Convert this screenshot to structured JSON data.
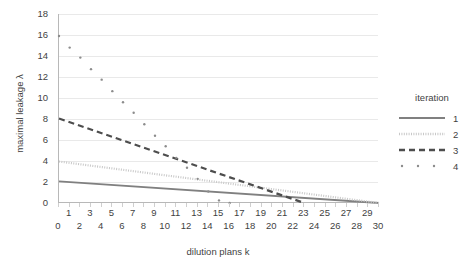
{
  "chart_data": {
    "type": "line",
    "title": "",
    "xlabel": "dilution plans k",
    "ylabel": "maximal leakage λ",
    "xlim": [
      0,
      30
    ],
    "ylim": [
      0,
      18
    ],
    "x_ticks": [
      0,
      1,
      2,
      3,
      4,
      5,
      6,
      7,
      8,
      9,
      10,
      11,
      12,
      13,
      14,
      15,
      16,
      17,
      18,
      19,
      20,
      21,
      22,
      23,
      24,
      25,
      26,
      27,
      28,
      29,
      30
    ],
    "x_tick_labels": [
      "0",
      "1",
      "2",
      "3",
      "4",
      "5",
      "6",
      "7",
      "8",
      "9",
      "10",
      "11",
      "12",
      "13",
      "14",
      "15",
      "16",
      "17",
      "18",
      "19",
      "20",
      "21",
      "22",
      "23",
      "24",
      "25",
      "26",
      "27",
      "28",
      "29",
      "30"
    ],
    "y_ticks": [
      0,
      2,
      4,
      6,
      8,
      10,
      12,
      14,
      16,
      18
    ],
    "y_tick_labels": [
      "0",
      "2",
      "4",
      "6",
      "8",
      "10",
      "12",
      "14",
      "16",
      "18"
    ],
    "grid": "horizontal",
    "legend_position": "right",
    "legend_title": "iteration",
    "series": [
      {
        "name": "1",
        "style": "solid",
        "color": "#808080",
        "x": [
          0,
          30
        ],
        "values": [
          2.05,
          0.0
        ]
      },
      {
        "name": "2",
        "style": "dotted",
        "color": "#c8c8c8",
        "x": [
          0,
          30
        ],
        "values": [
          3.95,
          0.0
        ]
      },
      {
        "name": "3",
        "style": "dashed",
        "color": "#4d4d4d",
        "x": [
          0,
          23
        ],
        "values": [
          8.05,
          0.0
        ]
      },
      {
        "name": "4",
        "style": "scatter",
        "color": "#8c8c8c",
        "x": [
          0,
          1,
          2,
          3,
          4,
          5,
          6,
          7,
          8,
          9,
          10,
          11,
          12,
          13,
          14,
          15,
          16,
          17,
          18,
          19,
          20,
          21,
          22,
          23
        ],
        "values": [
          15.9,
          14.8,
          13.85,
          12.75,
          11.75,
          10.65,
          9.6,
          8.6,
          7.5,
          6.4,
          5.4,
          4.3,
          3.35,
          2.3,
          1.1,
          0.25,
          0.0,
          0.0,
          0.0,
          0.0,
          0.0,
          0.0,
          0.0,
          0.0
        ]
      }
    ]
  },
  "legend": {
    "title": "iteration",
    "entries": [
      {
        "label": "1",
        "style": "solid"
      },
      {
        "label": "2",
        "style": "dotted"
      },
      {
        "label": "3",
        "style": "dashed"
      },
      {
        "label": "4",
        "style": "scatter"
      }
    ]
  },
  "axes": {
    "y_title": "maximal leakage λ",
    "x_title": "dilution plans k"
  }
}
